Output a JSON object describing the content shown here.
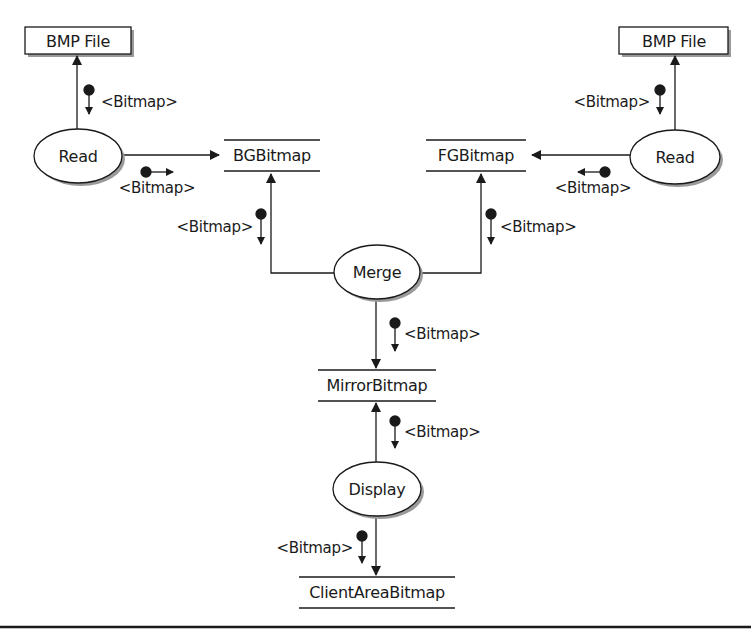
{
  "diagram": {
    "type": "structure-chart",
    "colors": {
      "ink": "#1a1a1a",
      "shadow": "#9a9a9a",
      "background": "#ffffff"
    },
    "terminators": [
      {
        "id": "bmp_left",
        "label": "BMP File"
      },
      {
        "id": "bmp_right",
        "label": "BMP File"
      }
    ],
    "processes": [
      {
        "id": "read_left",
        "label": "Read"
      },
      {
        "id": "read_right",
        "label": "Read"
      },
      {
        "id": "merge",
        "label": "Merge"
      },
      {
        "id": "display",
        "label": "Display"
      }
    ],
    "stores": [
      {
        "id": "bg",
        "label": "BGBitmap"
      },
      {
        "id": "fg",
        "label": "FGBitmap"
      },
      {
        "id": "mirror",
        "label": "MirrorBitmap"
      },
      {
        "id": "client",
        "label": "ClientAreaBitmap"
      }
    ],
    "couples": [
      {
        "id": "c1",
        "label": "<Bitmap>",
        "from": "read_left",
        "to": "bmp_left"
      },
      {
        "id": "c2",
        "label": "<Bitmap>",
        "from": "read_left",
        "to": "bg"
      },
      {
        "id": "c3",
        "label": "<Bitmap>",
        "from": "read_right",
        "to": "bmp_right"
      },
      {
        "id": "c4",
        "label": "<Bitmap>",
        "from": "read_right",
        "to": "fg"
      },
      {
        "id": "c5",
        "label": "<Bitmap>",
        "from": "merge",
        "to": "bg"
      },
      {
        "id": "c6",
        "label": "<Bitmap>",
        "from": "merge",
        "to": "fg"
      },
      {
        "id": "c7",
        "label": "<Bitmap>",
        "from": "merge",
        "to": "mirror"
      },
      {
        "id": "c8",
        "label": "<Bitmap>",
        "from": "display",
        "to": "mirror"
      },
      {
        "id": "c9",
        "label": "<Bitmap>",
        "from": "display",
        "to": "client"
      }
    ]
  }
}
